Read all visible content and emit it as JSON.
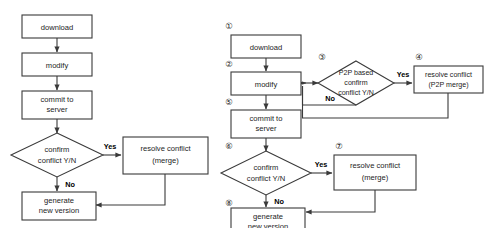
{
  "figure": {
    "type": "flowchart-pair",
    "stroke_color": "#3a3a3a",
    "text_color": "#1d1d1d",
    "background": "#ffffff"
  },
  "diagrams": [
    {
      "id": "left",
      "name": "centralized-version-control-flow",
      "nodes": [
        {
          "id": "l1",
          "shape": "rect",
          "label": "download",
          "lines": [
            "download"
          ]
        },
        {
          "id": "l2",
          "shape": "rect",
          "label": "modify",
          "lines": [
            "modify"
          ]
        },
        {
          "id": "l3",
          "shape": "rect",
          "label": "commit to server",
          "lines": [
            "commit to",
            "server"
          ]
        },
        {
          "id": "l4",
          "shape": "diamond",
          "label": "confirm conflict Y/N",
          "lines": [
            "confirm",
            "conflict  Y/N"
          ]
        },
        {
          "id": "l5",
          "shape": "rect",
          "label": "resolve conflict (merge)",
          "lines": [
            "resolve conflict",
            "(merge)"
          ]
        },
        {
          "id": "l6",
          "shape": "rect",
          "label": "generate new version",
          "lines": [
            "generate",
            "new version"
          ]
        }
      ],
      "edges": [
        {
          "from": "l1",
          "to": "l2",
          "label": ""
        },
        {
          "from": "l2",
          "to": "l3",
          "label": ""
        },
        {
          "from": "l3",
          "to": "l4",
          "label": ""
        },
        {
          "from": "l4",
          "to": "l5",
          "label": "Yes"
        },
        {
          "from": "l4",
          "to": "l6",
          "label": "No"
        },
        {
          "from": "l5",
          "to": "l6",
          "label": ""
        }
      ]
    },
    {
      "id": "right",
      "name": "p2p-assisted-version-control-flow",
      "nodes": [
        {
          "id": "r1",
          "shape": "rect",
          "step": "①",
          "label": "download",
          "lines": [
            "download"
          ]
        },
        {
          "id": "r2",
          "shape": "rect",
          "step": "②",
          "label": "modify",
          "lines": [
            "modify"
          ]
        },
        {
          "id": "r3",
          "shape": "diamond",
          "step": "③",
          "label": "P2P based confirm conflict Y/N",
          "lines": [
            "P2P based",
            "confirm",
            "conflict Y/N"
          ]
        },
        {
          "id": "r4",
          "shape": "rect",
          "step": "④",
          "label": "resolve conflict (P2P merge)",
          "lines": [
            "resolve conflict",
            "(P2P merge)"
          ]
        },
        {
          "id": "r5",
          "shape": "rect",
          "step": "⑤",
          "label": "commit to server",
          "lines": [
            "commit to",
            "server"
          ]
        },
        {
          "id": "r6",
          "shape": "diamond",
          "step": "⑥",
          "label": "confirm conflict Y/N",
          "lines": [
            "confirm",
            "conflict Y/N"
          ]
        },
        {
          "id": "r7",
          "shape": "rect",
          "step": "⑦",
          "label": "resolve conflict (merge)",
          "lines": [
            "resolve conflict",
            "(merge)"
          ]
        },
        {
          "id": "r8",
          "shape": "rect",
          "step": "⑧",
          "label": "generate new version",
          "lines": [
            "generate",
            "new version"
          ]
        }
      ],
      "edges": [
        {
          "from": "r1",
          "to": "r2",
          "label": ""
        },
        {
          "from": "r2",
          "to": "r3",
          "label": ""
        },
        {
          "from": "r3",
          "to": "r4",
          "label": "Yes"
        },
        {
          "from": "r3",
          "to": "r2",
          "label": "No"
        },
        {
          "from": "r4",
          "to": "r2",
          "label": ""
        },
        {
          "from": "r2",
          "to": "r5",
          "label": ""
        },
        {
          "from": "r5",
          "to": "r6",
          "label": ""
        },
        {
          "from": "r6",
          "to": "r7",
          "label": "Yes"
        },
        {
          "from": "r6",
          "to": "r8",
          "label": "No"
        },
        {
          "from": "r7",
          "to": "r8",
          "label": ""
        }
      ]
    }
  ],
  "labels": {
    "yes": "Yes",
    "no": "No"
  }
}
